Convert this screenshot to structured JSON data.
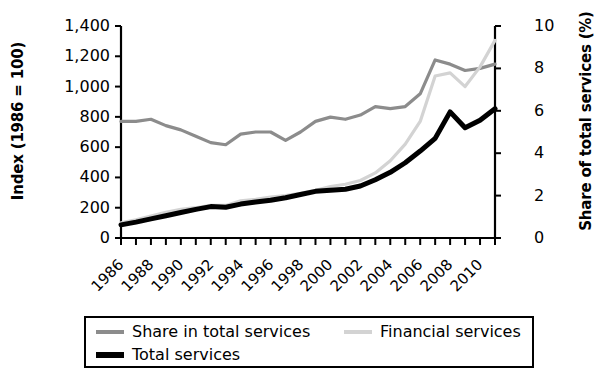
{
  "chart_data": {
    "type": "line",
    "title": "",
    "xlabel": "",
    "ylabel": "Index (1986 = 100)",
    "ylabel_right": "Share of total services (%)",
    "x": [
      1986,
      1987,
      1988,
      1989,
      1990,
      1991,
      1992,
      1993,
      1994,
      1995,
      1996,
      1997,
      1998,
      1999,
      2000,
      2001,
      2002,
      2003,
      2004,
      2005,
      2006,
      2007,
      2008,
      2009,
      2010,
      2011
    ],
    "xtick_labels": [
      "1986",
      "1988",
      "1990",
      "1992",
      "1994",
      "1996",
      "1998",
      "2000",
      "2002",
      "2004",
      "2006",
      "2008",
      "2010"
    ],
    "xtick_years": [
      1986,
      1988,
      1990,
      1992,
      1994,
      1996,
      1998,
      2000,
      2002,
      2004,
      2006,
      2008,
      2010
    ],
    "xlim": [
      1986,
      2011
    ],
    "ylim_left": [
      0,
      1400
    ],
    "ytick_labels_left": [
      "0",
      "200",
      "400",
      "600",
      "800",
      "1,000",
      "1,200",
      "1,400"
    ],
    "ytick_values_left": [
      0,
      200,
      400,
      600,
      800,
      1000,
      1200,
      1400
    ],
    "ylim_right": [
      0,
      10
    ],
    "ytick_labels_right": [
      "0",
      "2",
      "4",
      "6",
      "8",
      "10"
    ],
    "ytick_values_right": [
      0,
      2,
      4,
      6,
      8,
      10
    ],
    "grid": false,
    "legend_position": "bottom",
    "series": [
      {
        "name": "Share in total services",
        "axis": "right",
        "color": "#8c8c8c",
        "width": 3.2,
        "values": [
          5.5,
          5.5,
          5.6,
          5.3,
          5.1,
          4.8,
          4.5,
          4.4,
          4.9,
          5.0,
          5.0,
          4.6,
          5.0,
          5.5,
          5.7,
          5.6,
          5.8,
          6.2,
          6.1,
          6.2,
          6.8,
          8.4,
          8.2,
          7.9,
          8.0,
          8.2
        ]
      },
      {
        "name": "Financial services",
        "axis": "left",
        "color": "#d3d3d3",
        "width": 3.2,
        "values": [
          100,
          120,
          145,
          170,
          190,
          200,
          215,
          215,
          245,
          255,
          270,
          280,
          295,
          315,
          340,
          355,
          380,
          430,
          510,
          620,
          770,
          1070,
          1090,
          1000,
          1130,
          1305
        ]
      },
      {
        "name": "Total services",
        "axis": "right",
        "color": "#000000",
        "width": 5.0,
        "values": [
          0.62,
          0.75,
          0.9,
          1.05,
          1.2,
          1.35,
          1.48,
          1.45,
          1.6,
          1.7,
          1.78,
          1.9,
          2.05,
          2.2,
          2.25,
          2.3,
          2.45,
          2.75,
          3.1,
          3.55,
          4.1,
          4.7,
          5.95,
          5.2,
          5.55,
          6.1
        ]
      }
    ]
  },
  "legend": {
    "items": [
      {
        "label": "Share in total services",
        "color": "#8c8c8c",
        "width": 4
      },
      {
        "label": "Financial services",
        "color": "#d3d3d3",
        "width": 4
      },
      {
        "label": "Total services",
        "color": "#000000",
        "width": 6
      }
    ]
  }
}
